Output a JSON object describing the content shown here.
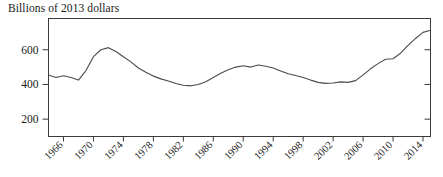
{
  "chart_data": {
    "type": "line",
    "title": "Billions of 2013 dollars",
    "xlabel": "",
    "ylabel": "",
    "xlim": [
      1964,
      2015
    ],
    "ylim": [
      100,
      780
    ],
    "grid": false,
    "legend": null,
    "ytick_labels": [
      "600",
      "400",
      "200"
    ],
    "ytick_values": [
      600,
      400,
      200
    ],
    "xtick_labels": [
      "1966",
      "1970",
      "1974",
      "1978",
      "1982",
      "1986",
      "1990",
      "1994",
      "1998",
      "2002",
      "2006",
      "2010",
      "2014"
    ],
    "xtick_values": [
      1966,
      1970,
      1974,
      1978,
      1982,
      1986,
      1990,
      1994,
      1998,
      2002,
      2006,
      2010,
      2014
    ],
    "series": [
      {
        "name": "Billions of 2013 dollars",
        "x": [
          1964,
          1965,
          1966,
          1967,
          1968,
          1969,
          1970,
          1971,
          1972,
          1973,
          1974,
          1975,
          1976,
          1977,
          1978,
          1979,
          1980,
          1981,
          1982,
          1983,
          1984,
          1985,
          1986,
          1987,
          1988,
          1989,
          1990,
          1991,
          1992,
          1993,
          1994,
          1995,
          1996,
          1997,
          1998,
          1999,
          2000,
          2001,
          2002,
          2003,
          2004,
          2005,
          2006,
          2007,
          2008,
          2009,
          2010,
          2011,
          2012,
          2013,
          2014,
          2015
        ],
        "y": [
          455,
          440,
          450,
          440,
          425,
          480,
          560,
          600,
          612,
          590,
          560,
          530,
          495,
          470,
          448,
          432,
          420,
          405,
          395,
          392,
          400,
          415,
          440,
          465,
          485,
          500,
          508,
          500,
          512,
          505,
          495,
          478,
          462,
          452,
          440,
          425,
          412,
          406,
          408,
          415,
          412,
          422,
          455,
          490,
          520,
          545,
          548,
          580,
          625,
          665,
          700,
          712
        ]
      }
    ],
    "annotations": []
  },
  "chart": {
    "title": "Billions of 2013 dollars"
  }
}
